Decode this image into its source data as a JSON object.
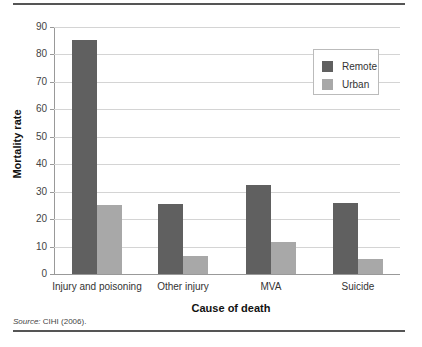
{
  "chart_data": {
    "type": "bar",
    "title": "",
    "xlabel": "Cause of death",
    "ylabel": "Mortality rate",
    "ylim": [
      0,
      90
    ],
    "yticks": [
      0,
      10,
      20,
      30,
      40,
      50,
      60,
      70,
      80,
      90
    ],
    "grid": true,
    "legend_position": "upper right",
    "categories": [
      "Injury and poisoning",
      "Other injury",
      "MVA",
      "Suicide"
    ],
    "series": [
      {
        "name": "Remote",
        "color": "#606060",
        "values": [
          85.3,
          25.5,
          32.5,
          26
        ]
      },
      {
        "name": "Urban",
        "color": "#a8a8a8",
        "values": [
          25,
          6.5,
          11.5,
          5.5
        ]
      }
    ]
  },
  "source": {
    "label": "Source:",
    "text": "CIHI (2006)."
  }
}
